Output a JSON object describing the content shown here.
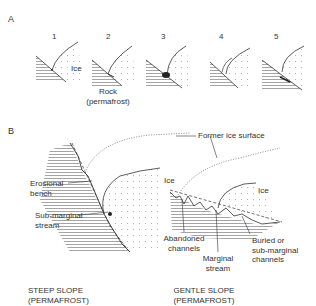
{
  "section_a": {
    "label": "A",
    "panels": [
      "1",
      "2",
      "3",
      "4",
      "5"
    ],
    "ice_label": "Ice",
    "rock_label_line1": "Rock",
    "rock_label_line2": "(permafrost)"
  },
  "section_b": {
    "label": "B",
    "former_ice_surface": "Former ice surface",
    "steep": {
      "ice_label": "Ice",
      "erosional_bench_line1": "Erosional",
      "erosional_bench_line2": "bench",
      "submarginal_line1": "Sub-marginal",
      "submarginal_line2": "stream",
      "caption_line1": "STEEP SLOPE",
      "caption_line2": "(PERMAFROST)"
    },
    "gentle": {
      "ice_label": "Ice",
      "abandoned_line1": "Abandoned",
      "abandoned_line2": "channels",
      "marginal_line1": "Marginal",
      "marginal_line2": "stream",
      "buried_line1": "Buried or",
      "buried_line2": "sub-marginal",
      "buried_line3": "channels",
      "caption_line1": "GENTLE SLOPE",
      "caption_line2": "(PERMAFROST)"
    }
  },
  "colors": {
    "ink": "#333333",
    "dots": "#9a9a9a",
    "hatch": "#555555"
  }
}
